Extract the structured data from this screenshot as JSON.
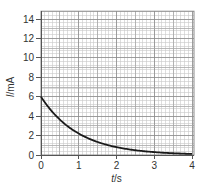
{
  "chart_data": {
    "type": "line",
    "title": "",
    "xlabel": "t/s",
    "ylabel": "I/mA",
    "xlabel_italic_part": "t",
    "xlabel_unit_part": "/s",
    "ylabel_italic_part": "I",
    "ylabel_unit_part": "/mA",
    "xlim": [
      0,
      4
    ],
    "ylim": [
      0,
      14.8
    ],
    "x_ticks": [
      0,
      1,
      2,
      3,
      4
    ],
    "y_ticks": [
      0,
      2,
      4,
      6,
      8,
      10,
      12,
      14
    ],
    "grid": true,
    "grid_minor": true,
    "legend": null,
    "series": [
      {
        "name": "current decay",
        "color": "#1a1a1a",
        "x": [
          0,
          0.25,
          0.5,
          0.75,
          1.0,
          1.25,
          1.5,
          1.75,
          2.0,
          2.25,
          2.5,
          2.75,
          3.0,
          3.25,
          3.5,
          3.75,
          4.0
        ],
        "values": [
          6.0,
          4.67,
          3.64,
          2.83,
          2.21,
          1.72,
          1.34,
          1.04,
          0.81,
          0.63,
          0.49,
          0.38,
          0.3,
          0.23,
          0.18,
          0.14,
          0.11
        ]
      }
    ]
  },
  "colors": {
    "grid_major": "#8c8c8c",
    "grid_minor": "#c8c8c8",
    "axis": "#555555",
    "curve": "#1a1a1a"
  }
}
